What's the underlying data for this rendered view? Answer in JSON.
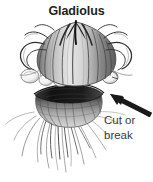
{
  "figure": {
    "title": "Gladiolus",
    "style": "black-and-white pen and ink botanical drawing",
    "background_color": "#ffffff",
    "title_color": "#231f20",
    "label_color": "#3a3a3a",
    "ink_color": "#2b2b2b"
  },
  "annotations": {
    "cut_label_line1": "Cut or",
    "cut_label_line2": "break",
    "arrow": {
      "name": "pointer-arrow",
      "direction": "up-left",
      "color": "#1a1a1a",
      "tail_x": 150,
      "tail_y": 112,
      "tip_x": 110,
      "tip_y": 95
    }
  },
  "parts": [
    {
      "name": "new-corm",
      "label": "new corm with papery husk"
    },
    {
      "name": "old-corm",
      "label": "old shriveled corm below"
    },
    {
      "name": "cleft",
      "label": "dark separation line between corms"
    },
    {
      "name": "cormlets",
      "label": "small round cormlets at base"
    },
    {
      "name": "roots",
      "label": "fine fibrous roots"
    }
  ]
}
